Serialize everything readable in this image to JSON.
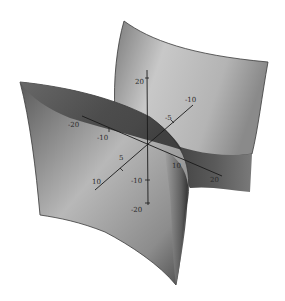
{
  "figure": {
    "surfaces": [
      {
        "name": "back-right-surface",
        "shade": "light-to-mid gray gradient"
      },
      {
        "name": "front-left-surface",
        "shade": "dark-to-light gray gradient"
      }
    ],
    "colors": {
      "background": "#ffffff",
      "axis": "#1a1a1a",
      "surface_light": "#d8d8d8",
      "surface_mid": "#9a9a9a",
      "surface_dark": "#3c3c3c"
    },
    "axes": {
      "vertical": {
        "ticks": [
          {
            "label": "20"
          },
          {
            "label": "-10"
          },
          {
            "label": "-20"
          }
        ]
      },
      "horizontal": {
        "ticks": [
          {
            "label": "-20"
          },
          {
            "label": "-10"
          },
          {
            "label": "10"
          },
          {
            "label": "20"
          }
        ]
      },
      "depth": {
        "ticks": [
          {
            "label": "-10"
          },
          {
            "label": "-5"
          },
          {
            "label": "5"
          },
          {
            "label": "10"
          }
        ]
      }
    }
  }
}
